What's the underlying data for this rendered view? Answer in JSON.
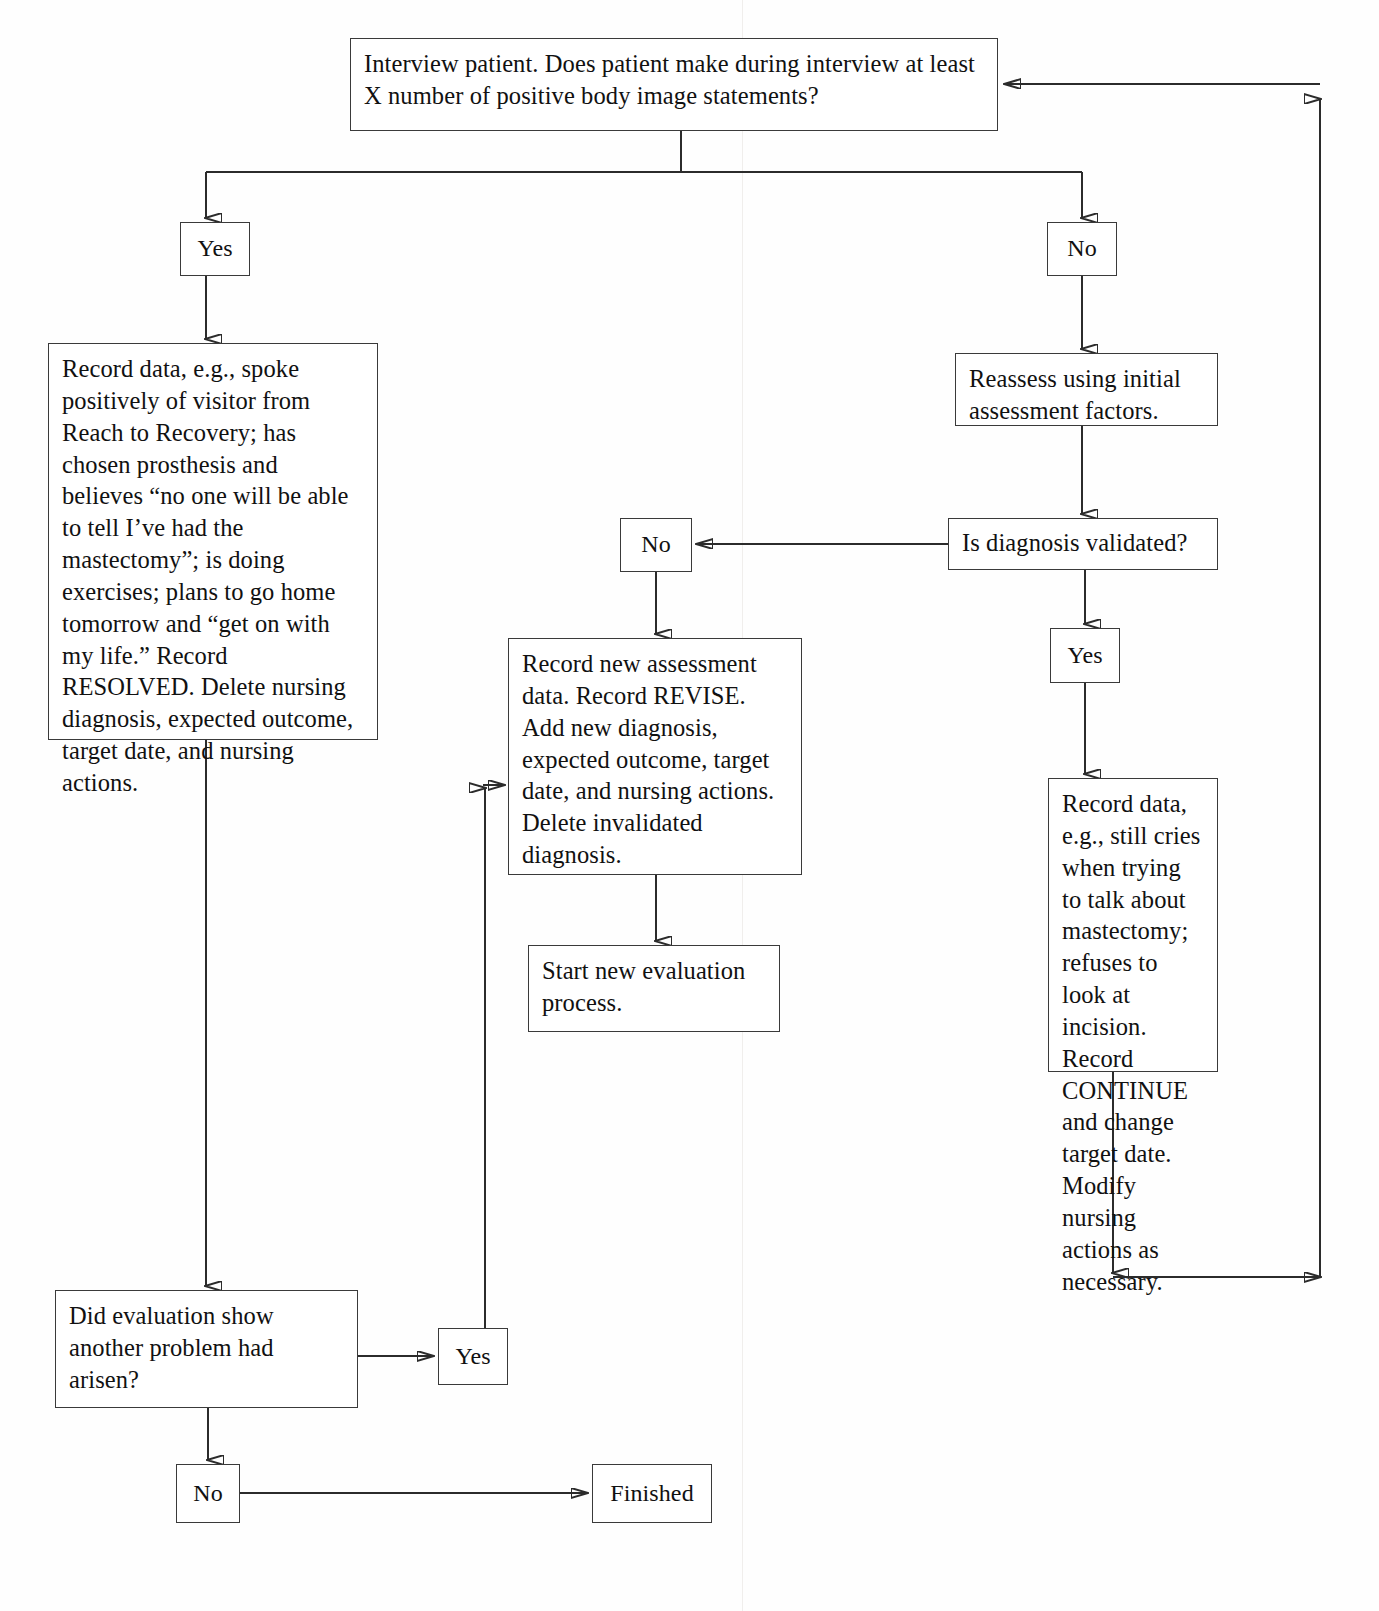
{
  "diagram": {
    "line_color": "#2b2b2b",
    "box_border_color": "#3a3a3a",
    "background": "#ffffff"
  },
  "nodes": {
    "interview": "Interview patient. Does patient make during interview at least X number of positive body image statements?",
    "yes_top": "Yes",
    "no_top": "No",
    "record_resolved": "Record data, e.g., spoke positively of visitor from Reach to Recovery; has chosen prosthesis and believes “no one will be able to tell I’ve had the mastectomy”; is doing exercises; plans to go home tomorrow and “get on with my life.” Record RESOLVED. Delete nursing diagnosis, expected outcome, target date, and nursing actions.",
    "reassess": "Reassess using initial assessment factors.",
    "validated": "Is diagnosis validated?",
    "no_middle": "No",
    "yes_right": "Yes",
    "record_revise": "Record new assessment data. Record REVISE. Add new diagnosis, expected outcome, target date, and nursing actions. Delete invalidated diagnosis.",
    "record_continue": "Record data, e.g., still cries when trying to talk about mastectomy; refuses to look at incision. Record CONTINUE and change target date. Modify nursing actions as necessary.",
    "start_new": "Start new evaluation process.",
    "did_evaluation": "Did evaluation show another problem  had arisen?",
    "yes_bottom": "Yes",
    "no_bottom": "No",
    "finished": "Finished"
  },
  "connector_labels": {
    "from_interview_yes": "Yes",
    "from_interview_no": "No",
    "from_validated_no": "No",
    "from_validated_yes": "Yes",
    "from_did_evaluation_yes": "Yes",
    "from_did_evaluation_no": "No"
  }
}
